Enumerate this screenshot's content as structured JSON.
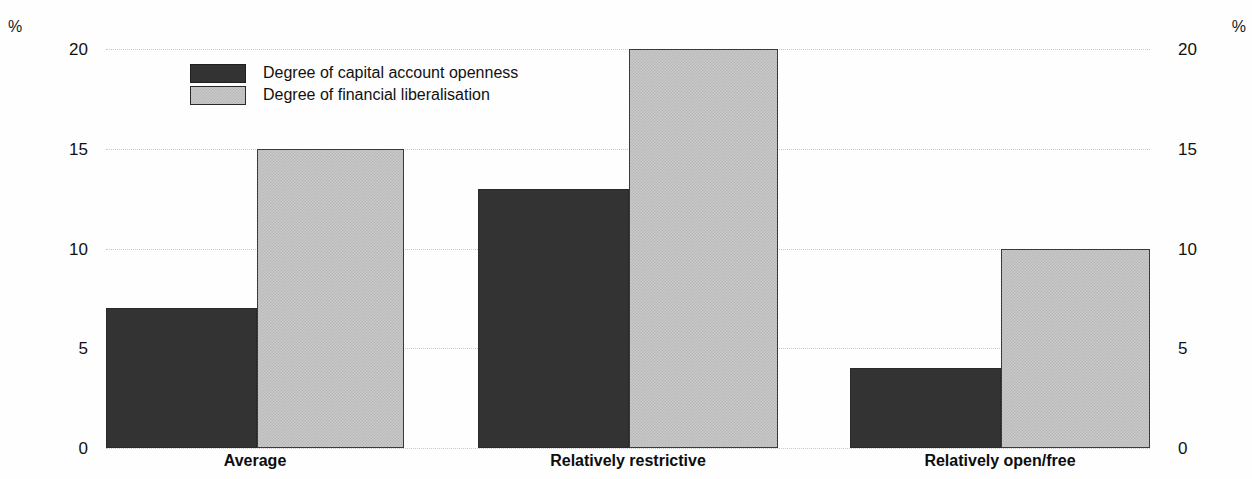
{
  "axis": {
    "unit_left": "%",
    "unit_right": "%",
    "ticks": [
      "0",
      "5",
      "10",
      "15",
      "20"
    ]
  },
  "legend": {
    "items": [
      {
        "label": "Degree of capital account openness",
        "swatch": "dark-swatch"
      },
      {
        "label": "Degree of financial liberalisation",
        "swatch": "light-swatch"
      }
    ]
  },
  "categories": [
    "Average",
    "Relatively restrictive",
    "Relatively open/free"
  ],
  "chart_data": {
    "type": "bar",
    "title": "",
    "xlabel": "",
    "ylabel": "%",
    "ylim": [
      0,
      20
    ],
    "yticks": [
      0,
      5,
      10,
      15,
      20
    ],
    "grid": true,
    "legend_position": "top-left inside plot",
    "categories": [
      "Average",
      "Relatively restrictive",
      "Relatively open/free"
    ],
    "series": [
      {
        "name": "Degree of capital account openness",
        "color": "#333333",
        "values": [
          7,
          13,
          4
        ]
      },
      {
        "name": "Degree of financial liberalisation",
        "color": "#c9c9c9",
        "values": [
          15,
          20,
          10
        ]
      }
    ]
  }
}
